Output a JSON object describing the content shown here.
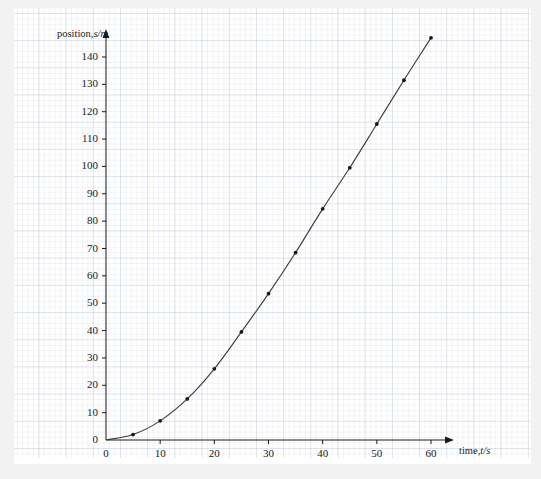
{
  "chart_data": {
    "type": "line",
    "title": "",
    "subtitle": "",
    "xlabel": "time, t/s",
    "ylabel": "position, s/m",
    "xlabel_text": "time,",
    "xlabel_symbol": "t/s",
    "ylabel_text": "position,",
    "ylabel_symbol": "s/m",
    "x": [
      0,
      5,
      10,
      15,
      20,
      25,
      30,
      35,
      40,
      45,
      50,
      55,
      60
    ],
    "values": [
      0,
      2,
      7,
      15,
      26,
      39.5,
      53.5,
      68.5,
      84.5,
      99.5,
      115.5,
      131.5,
      147
    ],
    "series": [
      {
        "name": "position",
        "values": [
          0,
          2,
          7,
          15,
          26,
          39.5,
          53.5,
          68.5,
          84.5,
          99.5,
          115.5,
          131.5,
          147
        ]
      }
    ],
    "xlim": [
      0,
      63
    ],
    "ylim": [
      0,
      150
    ],
    "xticks": [
      0,
      10,
      20,
      30,
      40,
      50,
      60
    ],
    "yticks": [
      0,
      10,
      20,
      30,
      40,
      50,
      60,
      70,
      80,
      90,
      100,
      110,
      120,
      130,
      140
    ],
    "xtick_labels": [
      "0",
      "10",
      "20",
      "30",
      "40",
      "50",
      "60"
    ],
    "ytick_labels": [
      "0",
      "10",
      "20",
      "30",
      "40",
      "50",
      "60",
      "70",
      "80",
      "90",
      "100",
      "110",
      "120",
      "130",
      "140"
    ],
    "grid": true,
    "grid_minor": true,
    "legend": null,
    "legend_position": "none",
    "marker": "dot",
    "line_color": "#3a3a3a",
    "marker_color": "#1a1a1a",
    "axis_color": "#1a1a1a",
    "grid_color": "#aab9c8",
    "background_color": "#ffffff",
    "page_background": "#f2f2f2",
    "annotations": []
  }
}
